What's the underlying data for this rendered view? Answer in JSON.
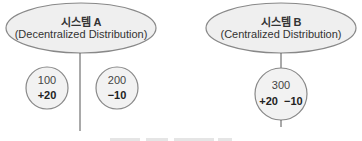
{
  "systems": [
    {
      "title": "시스템 A",
      "subtitle": "(Decentralized Distribution)",
      "nodes": [
        {
          "value": "100",
          "delta": "+20"
        },
        {
          "value": "200",
          "delta": "−10"
        }
      ]
    },
    {
      "title": "시스템 B",
      "subtitle": "(Centralized Distribution)",
      "nodes": [
        {
          "value": "300",
          "delta_plus": "+20",
          "delta_minus": "−10"
        }
      ]
    }
  ],
  "colors": {
    "ellipse_fill": "#efefef",
    "circle_fill": "#f2f2f2",
    "stroke": "#888888",
    "line": "#555555"
  }
}
